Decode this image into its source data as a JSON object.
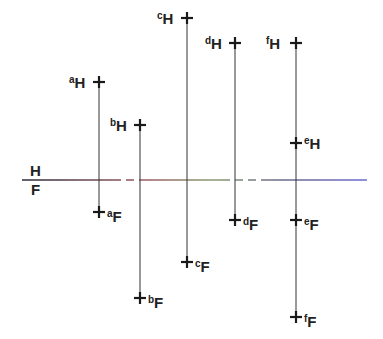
{
  "diagram": {
    "type": "descriptive-geometry-projection",
    "fold_line": {
      "y": 180,
      "x1": 22,
      "x2": 367,
      "label_top": "H",
      "label_bottom": "F",
      "color_left": "#2a2a3a",
      "color_mid": "#8a9a70",
      "color_right": "#6a6ad0"
    },
    "points": [
      {
        "name": "a",
        "x": 99,
        "h_y": 82,
        "f_y": 212,
        "h_label": "a",
        "f_label": "a",
        "h_side": "left",
        "f_side": "right"
      },
      {
        "name": "b",
        "x": 140,
        "h_y": 125,
        "f_y": 298,
        "h_label": "b",
        "f_label": "b",
        "h_side": "left",
        "f_side": "right"
      },
      {
        "name": "c",
        "x": 187,
        "h_y": 18,
        "f_y": 262,
        "h_label": "c",
        "f_label": "c",
        "h_side": "left",
        "f_side": "right"
      },
      {
        "name": "d",
        "x": 235,
        "h_y": 43,
        "f_y": 220,
        "h_label": "d",
        "f_label": "d",
        "h_side": "left",
        "f_side": "right"
      },
      {
        "name": "e",
        "x": 296,
        "h_y": 143,
        "f_y": 220,
        "h_label": "e",
        "f_label": "e",
        "h_side": "right",
        "f_side": "right"
      },
      {
        "name": "f",
        "x": 296,
        "h_y": 43,
        "f_y": 317,
        "h_label": "f",
        "f_label": "f",
        "h_side": "left",
        "f_side": "right"
      }
    ],
    "subscripts": {
      "top": "H",
      "bottom": "F"
    }
  }
}
